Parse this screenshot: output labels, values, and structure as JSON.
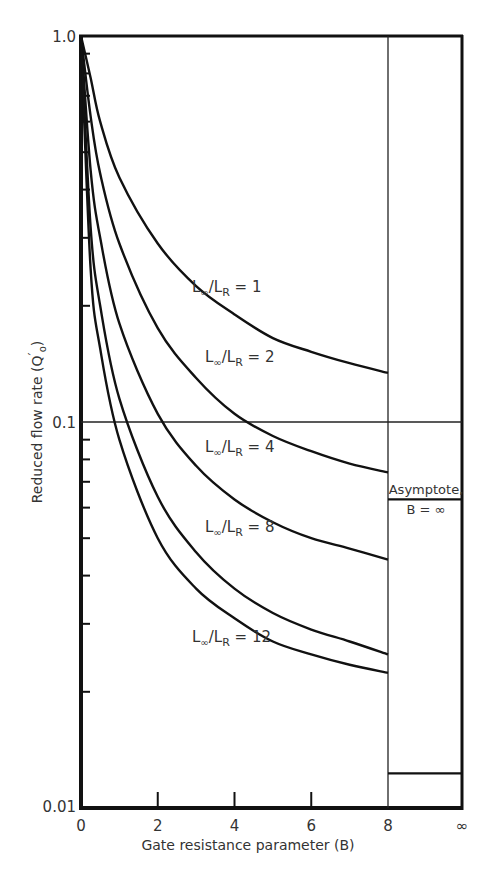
{
  "chart_data": {
    "type": "line",
    "title": "",
    "xlabel": "Gate resistance parameter (B)",
    "ylabel": "Reduced flow rate (Q'o)",
    "x_scale": "linear",
    "y_scale": "log",
    "xlim": [
      0,
      8
    ],
    "ylim": [
      0.01,
      1.0
    ],
    "x_ticks": [
      "0",
      "2",
      "4",
      "6",
      "8",
      "∞"
    ],
    "y_ticks": [
      "0.01",
      "0.1",
      "1.0"
    ],
    "grid": false,
    "reference_line_y": 0.1,
    "legend_position": "inline labels",
    "series": [
      {
        "name": "L∞/LR = 1",
        "label_main": "L",
        "sub1": "∞",
        "mid": "/L",
        "sub2": "R",
        "tail": " = 1",
        "x": [
          0,
          0.25,
          0.5,
          1,
          2,
          3,
          4,
          5,
          6,
          7,
          8
        ],
        "values": [
          1.0,
          0.78,
          0.6,
          0.43,
          0.29,
          0.225,
          0.19,
          0.165,
          0.152,
          0.142,
          0.134
        ]
      },
      {
        "name": "L∞/LR = 2",
        "label_main": "L",
        "sub1": "∞",
        "mid": "/L",
        "sub2": "R",
        "tail": " = 2",
        "x": [
          0,
          0.25,
          0.5,
          1,
          2,
          3,
          4,
          5,
          6,
          7,
          8
        ],
        "values": [
          1.0,
          0.62,
          0.44,
          0.29,
          0.175,
          0.13,
          0.105,
          0.092,
          0.084,
          0.078,
          0.074
        ]
      },
      {
        "name": "L∞/LR = 4",
        "label_main": "L",
        "sub1": "∞",
        "mid": "/L",
        "sub2": "R",
        "tail": " = 4",
        "x": [
          0,
          0.25,
          0.5,
          1,
          2,
          3,
          4,
          5,
          6,
          7,
          8
        ],
        "values": [
          1.0,
          0.45,
          0.3,
          0.18,
          0.105,
          0.077,
          0.063,
          0.055,
          0.05,
          0.047,
          0.044
        ]
      },
      {
        "name": "L∞/LR = 8",
        "label_main": "L",
        "sub1": "∞",
        "mid": "/L",
        "sub2": "R",
        "tail": " = 8",
        "x": [
          0,
          0.25,
          0.5,
          1,
          2,
          3,
          4,
          5,
          6,
          7,
          8
        ],
        "values": [
          1.0,
          0.32,
          0.2,
          0.115,
          0.064,
          0.046,
          0.037,
          0.032,
          0.029,
          0.027,
          0.025
        ]
      },
      {
        "name": "L∞/LR = 12",
        "label_main": "L",
        "sub1": "∞",
        "mid": "/L",
        "sub2": "R",
        "tail": " = 12",
        "x": [
          0,
          0.25,
          0.5,
          1,
          2,
          3,
          4,
          5,
          6,
          7,
          8
        ],
        "values": [
          1.0,
          0.25,
          0.155,
          0.09,
          0.05,
          0.037,
          0.031,
          0.027,
          0.025,
          0.0235,
          0.0224
        ]
      }
    ],
    "asymptote": {
      "label_line1": "Asymptote,",
      "label_line2": "B = ∞",
      "values_at_infinity": [
        0.063,
        0.0123
      ]
    }
  },
  "axes": {
    "x_tick_labels": [
      "0",
      "2",
      "4",
      "6",
      "8",
      "∞"
    ],
    "y_tick_labels": {
      "top": "1.0",
      "mid": "0.1",
      "bottom": "0.01"
    },
    "x_title": "Gate resistance parameter (B)",
    "y_title_main": "Reduced flow rate (Q",
    "y_title_sub": "o",
    "y_title_sup": "′",
    "y_title_close": ")"
  }
}
